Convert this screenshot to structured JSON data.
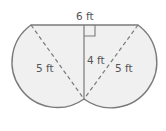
{
  "diagram": {
    "type": "composite-figure",
    "labels": {
      "top": "6 ft",
      "height": "4 ft",
      "left_diameter": "5 ft",
      "right_diameter": "5 ft"
    },
    "colors": {
      "stroke": "#7a7a7a",
      "fill": "#f0f0f0",
      "text": "#555555"
    }
  }
}
